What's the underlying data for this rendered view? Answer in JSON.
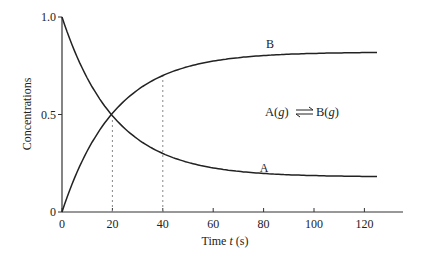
{
  "chart_data": {
    "type": "line",
    "title": "",
    "xlabel": "Time t (s)",
    "ylabel": "Concentrations",
    "xlim": [
      0,
      135
    ],
    "ylim": [
      0,
      1.0
    ],
    "x_ticks": [
      0,
      20,
      40,
      60,
      80,
      100,
      120
    ],
    "y_ticks": [
      0,
      0.5,
      1.0
    ],
    "y_tick_labels": [
      "0",
      "0.5",
      "1.0"
    ],
    "grid": false,
    "legend": "none (curves labeled inline)",
    "series": [
      {
        "name": "A",
        "model": "0.18 + 0.82*exp(-0.048*t)",
        "x": [
          0,
          10,
          20,
          30,
          40,
          50,
          60,
          70,
          80,
          100,
          125
        ],
        "values": [
          1.0,
          0.69,
          0.49,
          0.37,
          0.3,
          0.25,
          0.22,
          0.21,
          0.2,
          0.19,
          0.18
        ]
      },
      {
        "name": "B",
        "model": "0.82*(1 - exp(-0.048*t))",
        "x": [
          0,
          10,
          20,
          30,
          40,
          50,
          60,
          70,
          80,
          100,
          125
        ],
        "values": [
          0.0,
          0.31,
          0.51,
          0.63,
          0.7,
          0.75,
          0.78,
          0.79,
          0.8,
          0.81,
          0.82
        ]
      }
    ],
    "annotations": [
      {
        "text": "A(g) ⇌ B(g)",
        "position": "right-middle"
      },
      {
        "type": "dashed-vline",
        "x": 20,
        "from": 0,
        "to": "A curve"
      },
      {
        "type": "dashed-vline",
        "x": 40,
        "from": 0,
        "to": "B curve"
      },
      {
        "text": "A",
        "label_for": "series A",
        "at_x": 80
      },
      {
        "text": "B",
        "label_for": "series B",
        "at_x": 80
      }
    ]
  },
  "labels": {
    "xlabel_prefix": "Time ",
    "xlabel_var": "t",
    "xlabel_suffix": " (s)",
    "ylabel": "Concentrations",
    "curve_a": "A",
    "curve_b": "B",
    "eq_left": "A(",
    "eq_left_var": "g",
    "eq_left_close": ")",
    "eq_right": "B(",
    "eq_right_var": "g",
    "eq_right_close": ")"
  },
  "colors": {
    "curve": "#222222",
    "axis": "#333333",
    "dashed": "#888888"
  }
}
